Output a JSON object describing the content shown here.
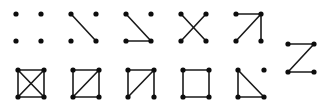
{
  "figure": {
    "background_color": "#ffffff",
    "edge_color": "#1a1a1a",
    "vertex_color": "#0d0d0d",
    "vertex_radius": 2.6,
    "edge_width": 1.6,
    "vertex_count_per_graph": 4,
    "graph_count": 11
  },
  "chart_data": {
    "type": "diagram",
    "vertex_labels": [
      "top-left",
      "top-right",
      "bottom-left",
      "bottom-right"
    ],
    "vertex_keys": [
      "tl",
      "tr",
      "bl",
      "br"
    ],
    "graphs": [
      {
        "name": "empty-graph",
        "row": 1,
        "column": 1,
        "edge_count": 0,
        "edges": [],
        "x": 16,
        "y": 14,
        "cell_width": 25,
        "cell_height": 27
      },
      {
        "name": "single-edge-graph",
        "row": 1,
        "column": 2,
        "edge_count": 1,
        "edges": [
          [
            "tl",
            "br"
          ]
        ],
        "x": 71,
        "y": 14,
        "cell_width": 25,
        "cell_height": 27
      },
      {
        "name": "path-p3-plus-isolated-vertex",
        "row": 1,
        "column": 3,
        "edge_count": 2,
        "edges": [
          [
            "tl",
            "br"
          ],
          [
            "bl",
            "br"
          ]
        ],
        "x": 126,
        "y": 14,
        "cell_width": 25,
        "cell_height": 27
      },
      {
        "name": "two-disjoint-edges-crossing",
        "row": 1,
        "column": 4,
        "edge_count": 2,
        "edges": [
          [
            "tl",
            "br"
          ],
          [
            "tr",
            "bl"
          ]
        ],
        "x": 181,
        "y": 14,
        "cell_width": 25,
        "cell_height": 27
      },
      {
        "name": "star-k13",
        "row": 1,
        "column": 5,
        "edge_count": 3,
        "edges": [
          [
            "tl",
            "tr"
          ],
          [
            "tr",
            "br"
          ],
          [
            "tr",
            "bl"
          ]
        ],
        "x": 236,
        "y": 14,
        "cell_width": 25,
        "cell_height": 27
      },
      {
        "name": "path-p4-zigzag",
        "row": 1.5,
        "column": 6,
        "edge_count": 3,
        "edges": [
          [
            "tl",
            "tr"
          ],
          [
            "tr",
            "bl"
          ],
          [
            "bl",
            "br"
          ]
        ],
        "x": 288,
        "y": 44,
        "cell_width": 26,
        "cell_height": 28
      },
      {
        "name": "complete-graph-k4",
        "row": 2,
        "column": 1,
        "edge_count": 6,
        "edges": [
          [
            "tl",
            "tr"
          ],
          [
            "bl",
            "br"
          ],
          [
            "tl",
            "bl"
          ],
          [
            "tr",
            "br"
          ],
          [
            "tl",
            "br"
          ],
          [
            "tr",
            "bl"
          ]
        ],
        "x": 18,
        "y": 70,
        "cell_width": 26,
        "cell_height": 27
      },
      {
        "name": "diamond-graph-k4-minus-edge",
        "row": 2,
        "column": 2,
        "edge_count": 5,
        "edges": [
          [
            "tl",
            "tr"
          ],
          [
            "bl",
            "br"
          ],
          [
            "tl",
            "bl"
          ],
          [
            "tr",
            "br"
          ],
          [
            "tr",
            "bl"
          ]
        ],
        "x": 73,
        "y": 70,
        "cell_width": 26,
        "cell_height": 27
      },
      {
        "name": "paw-triangle-with-pendant",
        "row": 2,
        "column": 3,
        "edge_count": 4,
        "edges": [
          [
            "tl",
            "tr"
          ],
          [
            "tl",
            "bl"
          ],
          [
            "tr",
            "bl"
          ],
          [
            "tr",
            "br"
          ]
        ],
        "x": 128,
        "y": 70,
        "cell_width": 26,
        "cell_height": 27
      },
      {
        "name": "cycle-c4",
        "row": 2,
        "column": 4,
        "edge_count": 4,
        "edges": [
          [
            "tl",
            "tr"
          ],
          [
            "tl",
            "bl"
          ],
          [
            "tr",
            "br"
          ],
          [
            "bl",
            "br"
          ]
        ],
        "x": 183,
        "y": 70,
        "cell_width": 26,
        "cell_height": 27
      },
      {
        "name": "triangle-plus-isolated-vertex",
        "row": 2,
        "column": 5,
        "edge_count": 3,
        "edges": [
          [
            "tl",
            "bl"
          ],
          [
            "bl",
            "br"
          ],
          [
            "tl",
            "br"
          ]
        ],
        "x": 238,
        "y": 70,
        "cell_width": 26,
        "cell_height": 27
      }
    ]
  }
}
